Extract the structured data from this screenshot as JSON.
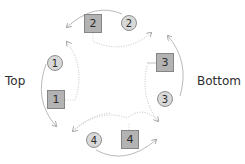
{
  "labels": {
    "left": "Top",
    "right": "Bottom"
  },
  "nodes": {
    "square_1": "1",
    "circle_1": "1",
    "square_2": "2",
    "circle_2": "2",
    "square_3": "3",
    "circle_3": "3",
    "square_4": "4",
    "circle_4": "4"
  },
  "colors": {
    "square_fill": "#b3b3b3",
    "square_border": "#858585",
    "circle_fill": "#d8d8d8",
    "circle_border": "#8f8f8f",
    "arrow": "#a0a0a0",
    "text": "#2b2b2b"
  }
}
